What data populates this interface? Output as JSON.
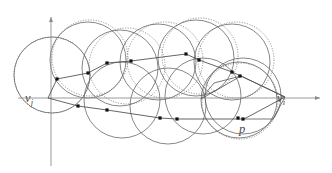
{
  "figure": {
    "type": "geometric-diagram",
    "width": 332,
    "height": 173,
    "background_color": "#ffffff",
    "stroke_color": "#5a5a5a",
    "axis_color": "#8a8a8a",
    "chain_color": "#555555",
    "point_color": "#1a1a1a",
    "labels": [
      {
        "id": "label-vj",
        "text": "v",
        "subscript": "j",
        "x": 25,
        "y": 92
      },
      {
        "id": "label-vi",
        "text": "v",
        "subscript": "i",
        "x": 277,
        "y": 92
      },
      {
        "id": "label-p",
        "text": "p",
        "subscript": "",
        "x": 239,
        "y": 123
      }
    ],
    "axes": {
      "horizontal": {
        "x1": 18,
        "y1": 98,
        "x2": 320,
        "y2": 98,
        "arrow": "right"
      },
      "vertical": {
        "x1": 51,
        "y1": 166,
        "x2": 51,
        "y2": 17,
        "arrow": "up"
      }
    },
    "circles_solid": [
      {
        "cx": 52,
        "cy": 75,
        "r": 38
      },
      {
        "cx": 88,
        "cy": 60,
        "r": 38
      },
      {
        "cx": 120,
        "cy": 68,
        "r": 38
      },
      {
        "cx": 122,
        "cy": 100,
        "r": 38
      },
      {
        "cx": 158,
        "cy": 62,
        "r": 38
      },
      {
        "cx": 168,
        "cy": 106,
        "r": 38
      },
      {
        "cx": 196,
        "cy": 58,
        "r": 38
      },
      {
        "cx": 203,
        "cy": 96,
        "r": 38
      },
      {
        "cx": 232,
        "cy": 62,
        "r": 38
      },
      {
        "cx": 239,
        "cy": 100,
        "r": 38
      },
      {
        "cx": 243,
        "cy": 96,
        "r": 38
      }
    ],
    "circles_dotted": [
      {
        "cx": 52,
        "cy": 75,
        "r": 38
      },
      {
        "cx": 90,
        "cy": 58,
        "r": 38
      },
      {
        "cx": 127,
        "cy": 66,
        "r": 38
      },
      {
        "cx": 165,
        "cy": 60,
        "r": 38
      },
      {
        "cx": 200,
        "cy": 56,
        "r": 38
      },
      {
        "cx": 236,
        "cy": 60,
        "r": 38
      },
      {
        "cx": 240,
        "cy": 101,
        "r": 38
      }
    ],
    "chain_upper": {
      "label": "upper-chain",
      "points": [
        {
          "x": 48,
          "y": 98
        },
        {
          "x": 57,
          "y": 79
        },
        {
          "x": 88,
          "y": 73
        },
        {
          "x": 107,
          "y": 63
        },
        {
          "x": 131,
          "y": 61
        },
        {
          "x": 186,
          "y": 54
        },
        {
          "x": 199,
          "y": 60
        },
        {
          "x": 232,
          "y": 72
        },
        {
          "x": 241,
          "y": 76
        },
        {
          "x": 285,
          "y": 97
        }
      ]
    },
    "chain_lower": {
      "label": "lower-chain",
      "points": [
        {
          "x": 48,
          "y": 98
        },
        {
          "x": 78,
          "y": 106
        },
        {
          "x": 107,
          "y": 110
        },
        {
          "x": 160,
          "y": 118
        },
        {
          "x": 177,
          "y": 119
        },
        {
          "x": 238,
          "y": 119
        },
        {
          "x": 244,
          "y": 119
        },
        {
          "x": 285,
          "y": 97
        }
      ]
    },
    "marked_points": [
      {
        "x": 57,
        "y": 79
      },
      {
        "x": 88,
        "y": 73
      },
      {
        "x": 107,
        "y": 63
      },
      {
        "x": 131,
        "y": 61
      },
      {
        "x": 186,
        "y": 54
      },
      {
        "x": 199,
        "y": 60
      },
      {
        "x": 232,
        "y": 72
      },
      {
        "x": 240,
        "y": 76
      },
      {
        "x": 78,
        "y": 106
      },
      {
        "x": 107,
        "y": 110
      },
      {
        "x": 160,
        "y": 118
      },
      {
        "x": 177,
        "y": 119
      },
      {
        "x": 238,
        "y": 118
      },
      {
        "x": 243,
        "y": 119
      }
    ],
    "extra_segments": [
      {
        "x1": 241,
        "y1": 76,
        "x2": 285,
        "y2": 97
      },
      {
        "x1": 241,
        "y1": 76,
        "x2": 201,
        "y2": 99
      },
      {
        "x1": 285,
        "y1": 97,
        "x2": 273,
        "y2": 119
      },
      {
        "x1": 273,
        "y1": 119,
        "x2": 244,
        "y2": 119
      },
      {
        "x1": 201,
        "y1": 99,
        "x2": 214,
        "y2": 83
      },
      {
        "x1": 214,
        "y1": 83,
        "x2": 241,
        "y2": 76
      }
    ]
  }
}
